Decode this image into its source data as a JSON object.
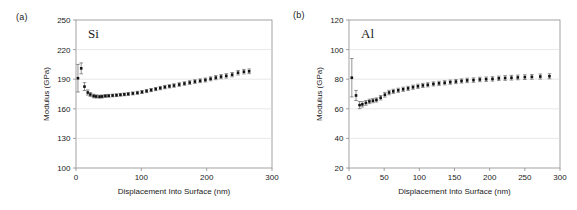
{
  "figure": {
    "panels": [
      {
        "tag": "(a)",
        "series_label": "Si",
        "xlabel": "Displacement Into Surface (nm)",
        "ylabel": "Modulus (GPa)"
      },
      {
        "tag": "(b)",
        "series_label": "Al",
        "xlabel": "Displacement Into Surface (nm)",
        "ylabel": "Modulus (GPa)"
      }
    ]
  },
  "chart_data": [
    {
      "type": "scatter",
      "panel": "(a)",
      "title": "Si",
      "xlabel": "Displacement Into Surface (nm)",
      "ylabel": "Modulus (GPa)",
      "xlim": [
        0,
        300
      ],
      "ylim": [
        100,
        250
      ],
      "xticks": [
        0,
        100,
        200,
        300
      ],
      "yticks": [
        100,
        130,
        160,
        190,
        220,
        250
      ],
      "grid": "horizontal",
      "legend": "none",
      "marker": "filled-square",
      "errorbars": true,
      "series": [
        {
          "name": "Si",
          "x": [
            3,
            8,
            13,
            18,
            22,
            27,
            31,
            36,
            40,
            45,
            50,
            56,
            62,
            68,
            74,
            80,
            87,
            94,
            101,
            108,
            115,
            122,
            129,
            136,
            143,
            150,
            158,
            166,
            174,
            182,
            190,
            198,
            206,
            214,
            222,
            230,
            239,
            248,
            257,
            265
          ],
          "y": [
            191.0,
            201.0,
            182.5,
            176.5,
            174.5,
            173.0,
            172.5,
            172.3,
            172.5,
            173.0,
            173.2,
            173.5,
            173.8,
            174.2,
            174.6,
            175.0,
            175.6,
            176.2,
            177.0,
            178.0,
            179.0,
            180.0,
            181.0,
            182.0,
            182.8,
            183.6,
            184.6,
            185.6,
            186.6,
            187.6,
            188.4,
            189.2,
            190.4,
            191.6,
            192.6,
            193.4,
            194.6,
            196.6,
            197.6,
            198.0
          ],
          "yerr": [
            14.0,
            5.5,
            4.0,
            2.6,
            2.0,
            1.8,
            1.6,
            1.5,
            1.5,
            1.4,
            1.4,
            1.4,
            1.4,
            1.4,
            1.4,
            1.4,
            1.5,
            1.5,
            1.5,
            1.6,
            1.6,
            1.6,
            1.7,
            1.7,
            1.7,
            1.8,
            1.8,
            1.8,
            1.9,
            1.9,
            1.9,
            2.0,
            2.0,
            2.1,
            2.1,
            2.2,
            2.2,
            2.3,
            2.3,
            2.4
          ]
        }
      ]
    },
    {
      "type": "scatter",
      "panel": "(b)",
      "title": "Al",
      "xlabel": "Displacement Into Surface (nm)",
      "ylabel": "Modulus (GPa)",
      "xlim": [
        0,
        300
      ],
      "ylim": [
        20,
        120
      ],
      "xticks": [
        0,
        50,
        100,
        150,
        200,
        250,
        300
      ],
      "yticks": [
        20,
        40,
        60,
        80,
        100,
        120
      ],
      "grid": "horizontal",
      "legend": "none",
      "marker": "filled-square",
      "errorbars": true,
      "series": [
        {
          "name": "Al",
          "x": [
            4,
            10,
            15,
            19,
            24,
            29,
            34,
            39,
            45,
            51,
            57,
            63,
            70,
            77,
            84,
            91,
            98,
            105,
            112,
            120,
            128,
            136,
            144,
            152,
            160,
            168,
            177,
            186,
            195,
            204,
            213,
            222,
            231,
            240,
            250,
            260,
            272,
            285
          ],
          "y": [
            81.0,
            69.0,
            62.5,
            63.0,
            64.0,
            65.0,
            65.5,
            66.0,
            67.5,
            69.5,
            71.0,
            71.8,
            72.5,
            73.2,
            73.8,
            74.6,
            75.2,
            75.8,
            76.2,
            76.8,
            77.2,
            77.6,
            78.0,
            78.4,
            78.8,
            79.2,
            79.4,
            79.8,
            80.0,
            80.2,
            80.6,
            80.8,
            81.0,
            81.2,
            81.4,
            81.6,
            81.8,
            82.0
          ],
          "yerr": [
            13.0,
            3.4,
            2.4,
            1.8,
            1.6,
            1.5,
            1.4,
            1.4,
            1.5,
            1.6,
            1.5,
            1.4,
            1.4,
            1.4,
            1.4,
            1.4,
            1.4,
            1.4,
            1.4,
            1.4,
            1.4,
            1.4,
            1.4,
            1.4,
            1.4,
            1.5,
            1.5,
            1.5,
            1.5,
            1.5,
            1.5,
            1.6,
            1.6,
            1.6,
            1.6,
            1.6,
            1.7,
            1.7
          ]
        }
      ]
    }
  ]
}
